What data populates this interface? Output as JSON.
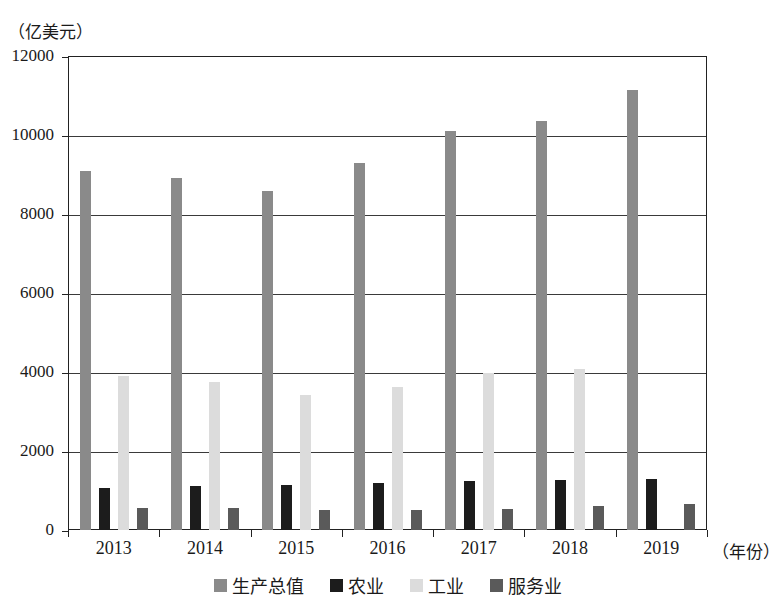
{
  "chart_data": {
    "type": "bar",
    "title": "",
    "subtitle": "",
    "unit_label": "（亿美元）",
    "xlabel": "（年份）",
    "ylabel": "",
    "categories": [
      "2013",
      "2014",
      "2015",
      "2016",
      "2017",
      "2018",
      "2019"
    ],
    "series": [
      {
        "name": "生产总值",
        "color": "#8a8a8a",
        "values": [
          9100,
          8900,
          8580,
          9280,
          10100,
          10350,
          11150
        ]
      },
      {
        "name": "农业",
        "color": "#1c1c1c",
        "values": [
          1060,
          1110,
          1130,
          1190,
          1240,
          1270,
          1300
        ]
      },
      {
        "name": "工业",
        "color": "#dcdcdc",
        "values": [
          3900,
          3750,
          3420,
          3620,
          3970,
          4080,
          null
        ]
      },
      {
        "name": "服务业",
        "color": "#5a5a5a",
        "values": [
          560,
          550,
          500,
          510,
          520,
          620,
          670
        ]
      }
    ],
    "ylim": [
      0,
      12000
    ],
    "y_ticks": [
      "0",
      "2000",
      "4000",
      "6000",
      "8000",
      "10000",
      "12000"
    ],
    "y_tick_values": [
      0,
      2000,
      4000,
      6000,
      8000,
      10000,
      12000
    ],
    "grid": true,
    "grid_axis": "y",
    "legend_position": "bottom",
    "frame": true
  },
  "axes": {
    "unit_caption": "（亿美元）",
    "x_title": "（年份）"
  },
  "legend": {
    "items": [
      {
        "label": "生产总值",
        "color": "#8a8a8a"
      },
      {
        "label": "农业",
        "color": "#1c1c1c"
      },
      {
        "label": "工业",
        "color": "#dcdcdc"
      },
      {
        "label": "服务业",
        "color": "#5a5a5a"
      }
    ]
  }
}
